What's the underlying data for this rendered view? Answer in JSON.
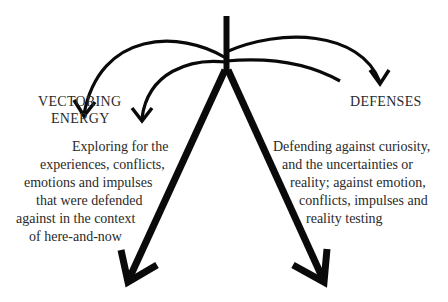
{
  "diagram": {
    "labels": {
      "left_title_line1": "VECTORING",
      "left_title_line2": "ENERGY",
      "right_title": "DEFENSES"
    },
    "left_text": {
      "lines": [
        "Exploring for the",
        "experiences, conflicts,",
        "emotions and impulses",
        "that were defended",
        "against in the context",
        "of here-and-now"
      ]
    },
    "right_text": {
      "lines": [
        "Defending against curiosity,",
        "and the uncertainties or",
        "reality; against emotion,",
        "conflicts, impulses and",
        "reality testing"
      ]
    },
    "colors": {
      "stroke": "#0a0a0a",
      "text": "#2a2a2a",
      "background": "#ffffff"
    }
  }
}
